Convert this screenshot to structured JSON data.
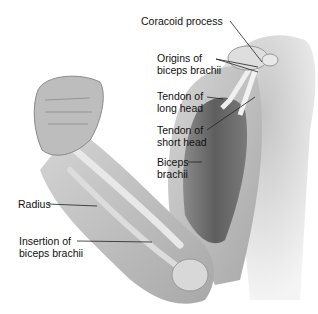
{
  "labels": {
    "coracoid": "Coracoid process",
    "origins_1": "Origins of",
    "origins_2": "biceps brachii",
    "long_1": "Tendon of",
    "long_2": "long head",
    "short_1": "Tendon of",
    "short_2": "short head",
    "biceps_1": "Biceps",
    "biceps_2": "brachii",
    "radius": "Radius",
    "insertion_1": "Insertion of",
    "insertion_2": "biceps brachii"
  },
  "colors": {
    "skin": "#c8c8c8",
    "skin_dark": "#9a9a9a",
    "muscle": "#6e6e6e",
    "bone": "#e6e6e6",
    "leader": "#222222"
  }
}
